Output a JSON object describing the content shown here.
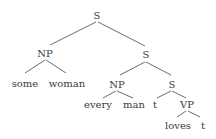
{
  "tree": {
    "root": "S",
    "np1": "NP",
    "some": "some",
    "woman": "woman",
    "s1": "S",
    "np2": "NP",
    "every": "every",
    "man": "man",
    "s2": "S",
    "t1": "t",
    "vp": "VP",
    "loves": "loves",
    "t2": "t"
  }
}
